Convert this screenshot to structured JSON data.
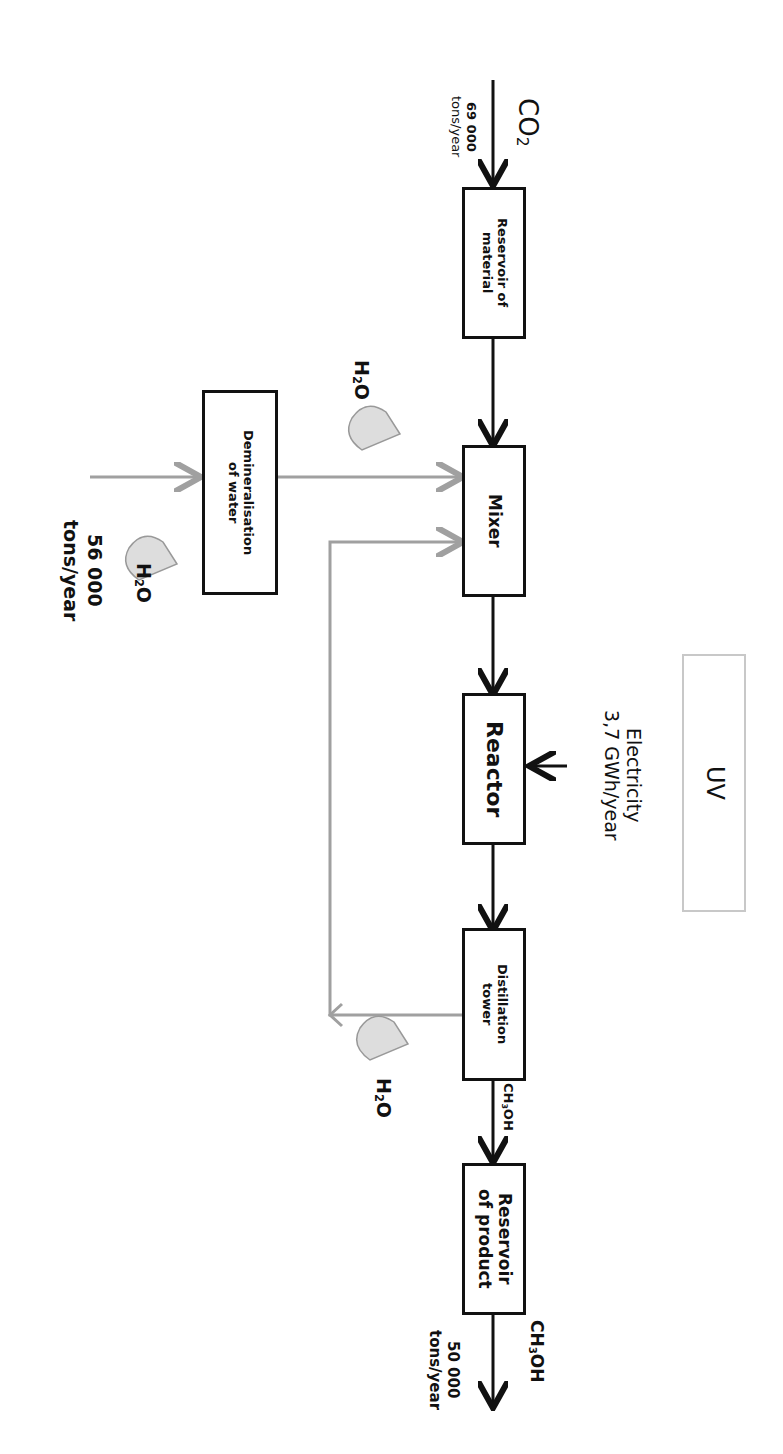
{
  "diagram": {
    "orientation": "rotated-90-clockwise",
    "colors": {
      "main_flow": "#111111",
      "water_flow": "#a0a0a0",
      "uv_border": "#c8c8c8",
      "drop_fill": "#dddddd"
    },
    "nodes": {
      "reservoir_material": "Reservoir of\nmaterial",
      "mixer": "Mixer",
      "reactor": "Reactor",
      "distillation": "Distillation\ntower",
      "reservoir_product": "Reservoir\nof product",
      "demineralisation": "Demineralisation\nof water",
      "uv": "UV"
    },
    "inputs": {
      "co2": {
        "label": "CO",
        "sub": "2",
        "amount": "69 000",
        "unit": "tons/year"
      },
      "water_in": {
        "label": "H",
        "sub": "2",
        "tail": "O",
        "amount": "56 000",
        "unit": "tons/year"
      },
      "water_mixer": {
        "label": "H",
        "sub": "2",
        "tail": "O"
      },
      "electricity": {
        "label": "Electricity",
        "amount": "3,7 GWh/year"
      }
    },
    "outputs": {
      "water_recycle": {
        "label": "H",
        "sub": "2",
        "tail": "O"
      },
      "ch3oh_mid": {
        "label": "CH",
        "sub": "3",
        "tail": "OH"
      },
      "ch3oh_out": {
        "label": "CH",
        "sub": "3",
        "tail": "OH",
        "amount": "50 000",
        "unit": "tons/year"
      }
    }
  }
}
